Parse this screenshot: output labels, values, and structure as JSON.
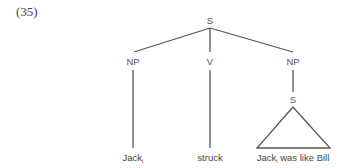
{
  "example": {
    "number": "(35)"
  },
  "tree": {
    "root": {
      "label": "S"
    },
    "children": [
      {
        "label": "NP",
        "leaf": {
          "text": "Jack",
          "subscript": "i"
        }
      },
      {
        "label": "V",
        "leaf": {
          "text": "struck"
        }
      },
      {
        "label": "NP",
        "child": {
          "label": "S",
          "triangle_leaf": {
            "text_before": "Jack",
            "subscript": "i",
            "text_after": " was like Bill"
          }
        }
      }
    ]
  },
  "colors": {
    "line": "#555555",
    "text": "#444444",
    "background": "#ffffff"
  }
}
